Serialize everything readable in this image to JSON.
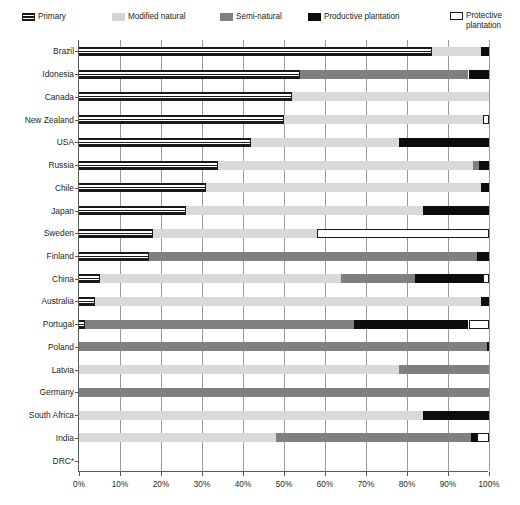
{
  "legend": {
    "items": [
      {
        "key": "primary",
        "label": "Primary",
        "swatch": "primary-swatch",
        "color": "#1a1a1a",
        "x": 22,
        "y": 12,
        "multiline": false
      },
      {
        "key": "modified",
        "label": "Modified natural",
        "swatch": "modified-swatch",
        "color": "#d4d4d4",
        "x": 112,
        "y": 12,
        "multiline": false
      },
      {
        "key": "semi",
        "label": "Semi-natural",
        "swatch": "semi-swatch",
        "color": "#808080",
        "x": 220,
        "y": 12,
        "multiline": false
      },
      {
        "key": "productive",
        "label": "Productive plantation",
        "swatch": "productive-swatch",
        "color": "#0d0d0d",
        "x": 308,
        "y": 12,
        "multiline": false
      },
      {
        "key": "protective",
        "label": "Protective plantation",
        "swatch": "protective-swatch",
        "color": "#ffffff",
        "x": 450,
        "y": 11,
        "multiline": true
      }
    ]
  },
  "axis": {
    "x_ticks": [
      "0%",
      "10%",
      "20%",
      "30%",
      "40%",
      "50%",
      "60%",
      "70%",
      "80%",
      "90%",
      "100%"
    ],
    "x_min": 0,
    "x_max": 100
  },
  "footnote": "",
  "chart_data": {
    "type": "bar",
    "orientation": "horizontal",
    "stacked": true,
    "normalized": true,
    "title": "",
    "xlabel": "",
    "ylabel": "",
    "xlim": [
      0,
      100
    ],
    "grid": "vertical",
    "legend_position": "top",
    "series": [
      {
        "name": "Primary",
        "key": "primary",
        "color": "#1a1a1a",
        "pattern": "horizontal-stripes"
      },
      {
        "name": "Modified natural",
        "key": "modified",
        "color": "#d9d9d9",
        "pattern": "solid"
      },
      {
        "name": "Semi-natural",
        "key": "semi",
        "color": "#7f7f7f",
        "pattern": "solid"
      },
      {
        "name": "Productive plantation",
        "key": "productive",
        "color": "#0d0d0d",
        "pattern": "solid"
      },
      {
        "name": "Protective plantation",
        "key": "protective",
        "color": "#ffffff",
        "pattern": "outline"
      }
    ],
    "categories": [
      "Brazil",
      "Idonesia",
      "Canada",
      "New Zealand",
      "USA",
      "Russia",
      "Chile",
      "Japan",
      "Sweden",
      "Finland",
      "China",
      "Australia",
      "Portugal",
      "Poland",
      "Latvia",
      "Germany",
      "South Africa",
      "India",
      "DRC*"
    ],
    "rows": [
      {
        "category": "Brazil",
        "primary": 86,
        "modified": 12,
        "semi": 0,
        "productive": 2,
        "protective": 0
      },
      {
        "category": "Idonesia",
        "primary": 54,
        "modified": 0,
        "semi": 41,
        "productive": 5,
        "protective": 0
      },
      {
        "category": "Canada",
        "primary": 52,
        "modified": 48,
        "semi": 0,
        "productive": 0,
        "protective": 0
      },
      {
        "category": "New Zealand",
        "primary": 50,
        "modified": 48.5,
        "semi": 0,
        "productive": 0,
        "protective": 1.5
      },
      {
        "category": "USA",
        "primary": 42,
        "modified": 36,
        "semi": 0,
        "productive": 22,
        "protective": 0
      },
      {
        "category": "Russia",
        "primary": 34,
        "modified": 62,
        "semi": 1.5,
        "productive": 2.5,
        "protective": 0
      },
      {
        "category": "Chile",
        "primary": 31,
        "modified": 67,
        "semi": 0,
        "productive": 2,
        "protective": 0
      },
      {
        "category": "Japan",
        "primary": 26,
        "modified": 58,
        "semi": 0,
        "productive": 16,
        "protective": 0
      },
      {
        "category": "Sweden",
        "primary": 18,
        "modified": 40,
        "semi": 0,
        "productive": 0,
        "protective": 42
      },
      {
        "category": "Finland",
        "primary": 17,
        "modified": 0,
        "semi": 80,
        "productive": 3,
        "protective": 0
      },
      {
        "category": "China",
        "primary": 5,
        "modified": 59,
        "semi": 18,
        "productive": 16.5,
        "protective": 1.5
      },
      {
        "category": "Australia",
        "primary": 4,
        "modified": 94,
        "semi": 0,
        "productive": 2,
        "protective": 0
      },
      {
        "category": "Portugal",
        "primary": 1.5,
        "modified": 0,
        "semi": 65.5,
        "productive": 28,
        "protective": 5
      },
      {
        "category": "Poland",
        "primary": 0,
        "modified": 0,
        "semi": 99.5,
        "productive": 0.5,
        "protective": 0
      },
      {
        "category": "Latvia",
        "primary": 0,
        "modified": 78,
        "semi": 22,
        "productive": 0,
        "protective": 0
      },
      {
        "category": "Germany",
        "primary": 0,
        "modified": 0,
        "semi": 100,
        "productive": 0,
        "protective": 0
      },
      {
        "category": "South Africa",
        "primary": 0,
        "modified": 84,
        "semi": 0,
        "productive": 16,
        "protective": 0
      },
      {
        "category": "India",
        "primary": 0,
        "modified": 48,
        "semi": 47.5,
        "productive": 1.5,
        "protective": 3
      },
      {
        "category": "DRC*",
        "primary": 0,
        "modified": 0,
        "semi": 0,
        "productive": 0,
        "protective": 0
      }
    ]
  }
}
